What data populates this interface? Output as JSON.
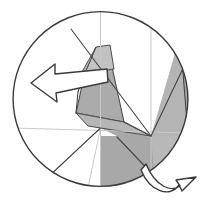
{
  "figure": {
    "title": "Paper folding diagram",
    "type": "geometric-fold-diagram",
    "canvas": {
      "width": 202,
      "height": 204,
      "background": "#ffffff"
    },
    "colors": {
      "outline": "#3a3a3a",
      "fold_line_strong": "#444444",
      "fold_line_faint": "#c9c9c9",
      "shade_dark": "#a8a8a8",
      "shade_medium": "#b4b4b4",
      "shade_light": "#c4c4c4",
      "arrow_fill": "#ffffff",
      "arrow_stroke": "#3a3a3a",
      "paper": "#ffffff"
    },
    "circle": {
      "label": "outer-circle",
      "cx": 100.5,
      "cy": 99,
      "r": 88,
      "stroke_width": 1.3
    },
    "shaded_regions": [
      {
        "name": "upper-flap-top",
        "shade": "shade_light",
        "points": "96,48 108,45 112,68 85,72"
      },
      {
        "name": "upper-flap-left-sliver",
        "shade": "shade_medium",
        "points": "96,48 85,72 76,90 84,70"
      },
      {
        "name": "center-flap-body",
        "shade": "shade_dark",
        "points": "85,72 112,68 122,121 76,114"
      },
      {
        "name": "center-flap-lower-wedge",
        "shade": "shade_medium",
        "points": "76,114 122,121 151,136 92,128"
      },
      {
        "name": "lower-right-quadrant",
        "shade": "shade_dark",
        "points": "151,136 188,136 188,174 151,188"
      },
      {
        "name": "lower-right-inner-triangle",
        "shade": "shade_medium",
        "points": "151,136 188,136 151,188"
      },
      {
        "name": "right-edge-lune",
        "shade": "shade_dark",
        "points": "180,36 188,136 178,132"
      }
    ],
    "fold_lines": [
      {
        "name": "diagonal-main",
        "from": [
          72,
          30
        ],
        "to": [
          151,
          136
        ],
        "weight": "strong"
      },
      {
        "name": "diagonal-upper-right",
        "from": [
          151,
          136
        ],
        "to": [
          188,
          60
        ],
        "weight": "strong"
      },
      {
        "name": "vertical-center",
        "from": [
          100.5,
          11
        ],
        "to": [
          100.5,
          188
        ],
        "weight": "faint"
      },
      {
        "name": "horizontal-center",
        "from": [
          13,
          128
        ],
        "to": [
          188,
          136
        ],
        "weight": "faint"
      },
      {
        "name": "vertical-right",
        "from": [
          151,
          14
        ],
        "to": [
          151,
          188
        ],
        "weight": "faint"
      },
      {
        "name": "lower-left-radial-a",
        "from": [
          100.5,
          128
        ],
        "to": [
          46,
          177
        ]
      },
      {
        "name": "lower-left-radial-b",
        "from": [
          100.5,
          128
        ],
        "to": [
          86,
          188
        ]
      },
      {
        "name": "lower-right-crease",
        "from": [
          118,
          136
        ],
        "to": [
          160,
          180
        ]
      },
      {
        "name": "right-lune-crease",
        "from": [
          180,
          36
        ],
        "to": [
          188,
          136
        ]
      }
    ],
    "arrows": [
      {
        "name": "fold-left-arrow",
        "direction": "left",
        "style": "block-arrow-outline",
        "tip": [
          31,
          83
        ]
      },
      {
        "name": "rotate-right-arrow",
        "direction": "right-curved",
        "style": "curved-block-arrow-outline",
        "tip": [
          192,
          178
        ]
      }
    ],
    "annotations": []
  }
}
